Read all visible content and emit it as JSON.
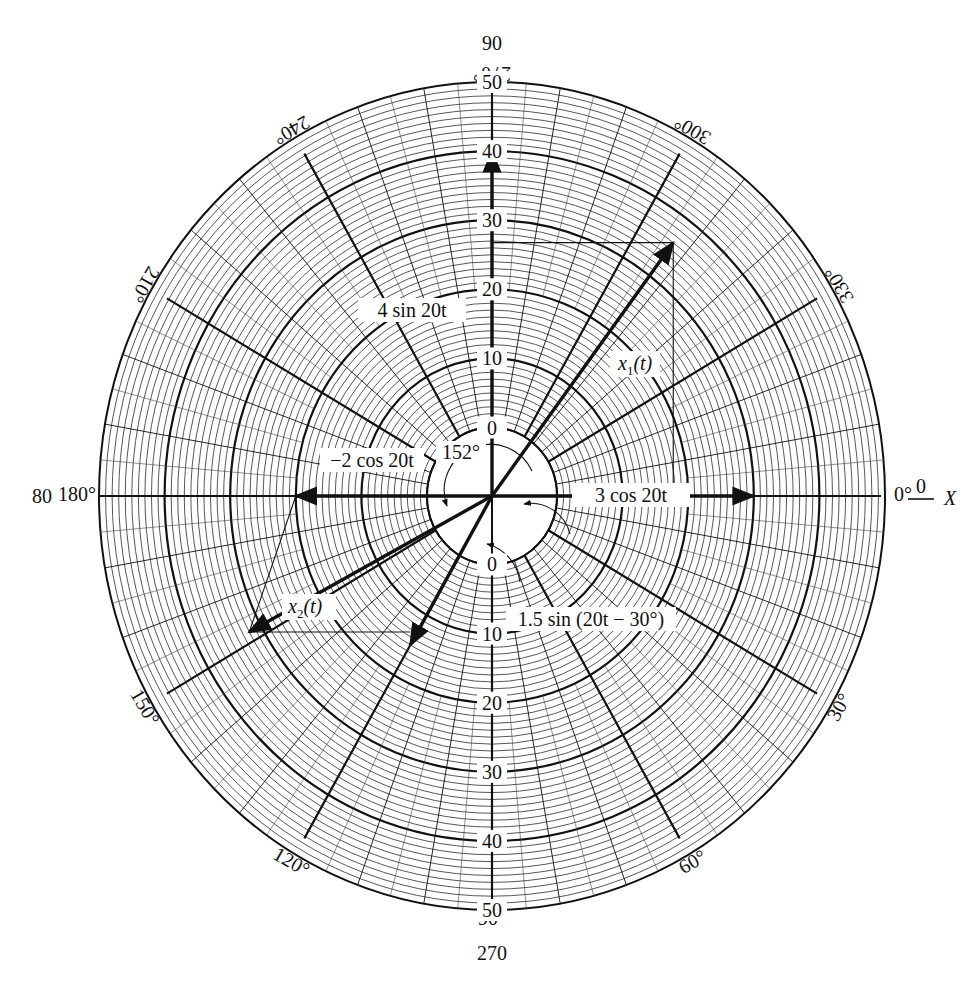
{
  "diagram": {
    "type": "polar_phasor_diagram",
    "center": {
      "x": 492,
      "y": 496
    },
    "scale": {
      "rx_outer": 393,
      "ry_outer": 414,
      "hub_value": 0,
      "max_value": 50,
      "major_step": 10,
      "minor_step": 1
    },
    "colors": {
      "ink": "#111111",
      "minor_ring": "#444444",
      "background": "#ffffff"
    },
    "outer_labels": {
      "top": "90",
      "left": "80",
      "bottom": "270",
      "right_axis_value": "0",
      "right_axis_name": "X"
    },
    "angle_labels": [
      {
        "deg": 0,
        "text": "0°"
      },
      {
        "deg": 30,
        "text": "30°"
      },
      {
        "deg": 60,
        "text": "60°"
      },
      {
        "deg": 90,
        "text": "90°"
      },
      {
        "deg": 120,
        "text": "120°"
      },
      {
        "deg": 150,
        "text": "150°"
      },
      {
        "deg": 180,
        "text": "180°"
      },
      {
        "deg": 210,
        "text": "210°"
      },
      {
        "deg": 240,
        "text": "240°"
      },
      {
        "deg": 270,
        "text": "270°"
      },
      {
        "deg": 300,
        "text": "300°"
      },
      {
        "deg": 330,
        "text": "330°"
      }
    ],
    "radial_scale_labels": {
      "up": [
        "0",
        "10",
        "20",
        "30",
        "40",
        "50"
      ],
      "down": [
        "0",
        "10",
        "20",
        "30",
        "40",
        "50"
      ]
    },
    "phasors": [
      {
        "id": "x1",
        "label": "x1(t)",
        "magnitude": 3.6,
        "angle_deg": 53,
        "note": "resultant of 3 cos 20t and 4 sin 20t"
      },
      {
        "id": "sin4",
        "label": "4 sin 20t",
        "magnitude": 4,
        "angle_deg": 90
      },
      {
        "id": "cos3",
        "label": "3 cos 20t",
        "magnitude": 3,
        "angle_deg": 0
      },
      {
        "id": "cosm2",
        "label": "−2 cos 20t",
        "magnitude": 2,
        "angle_deg": 180
      },
      {
        "id": "sin15",
        "label": "1.5 sin (20t − 30°)",
        "magnitude": 1.5,
        "angle_deg": 240
      },
      {
        "id": "x2",
        "label": "x2(t)",
        "magnitude": 3.2,
        "angle_deg": 208,
        "note": "resultant of −2 cos 20t and 1.5 sin (20t − 30°)"
      }
    ],
    "annotations": {
      "angle_152": "152°",
      "label_sin4": "4 sin 20t",
      "label_cos3": "3 cos 20t",
      "label_cosm2": "−2 cos 20t",
      "label_sin15": "1.5 sin (20t − 30°)",
      "label_x1_main": "x",
      "label_x1_sub": "1",
      "label_x1_arg": "(t)",
      "label_x2_main": "x",
      "label_x2_sub": "2",
      "label_x2_arg": "(t)"
    }
  }
}
